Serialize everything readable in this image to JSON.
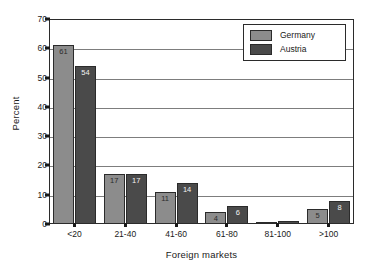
{
  "chart_data": {
    "type": "bar",
    "title": "",
    "xlabel": "Foreign markets",
    "ylabel": "Percent",
    "categories": [
      "<20",
      "21-40",
      "41-60",
      "61-80",
      "81-100",
      ">100"
    ],
    "series": [
      {
        "name": "Germany",
        "color": "#8c8c8c",
        "values": [
          61,
          17,
          11,
          4,
          0,
          5
        ],
        "labels": [
          "61",
          "17",
          "11",
          "4",
          "",
          "5"
        ]
      },
      {
        "name": "Austria",
        "color": "#4a4a4a",
        "values": [
          54,
          17,
          14,
          6,
          1,
          8
        ],
        "labels": [
          "54",
          "17",
          "14",
          "6",
          "",
          "8"
        ]
      }
    ],
    "ylim": [
      0,
      70
    ],
    "yticks": [
      0,
      10,
      20,
      30,
      40,
      50,
      60,
      70
    ],
    "ytick_labels": [
      "0",
      "10",
      "20",
      "30",
      "40",
      "50",
      "60",
      "70"
    ],
    "grid": true,
    "legend_position": "top-right",
    "legend_entries": [
      "Germany",
      "Austria"
    ]
  }
}
